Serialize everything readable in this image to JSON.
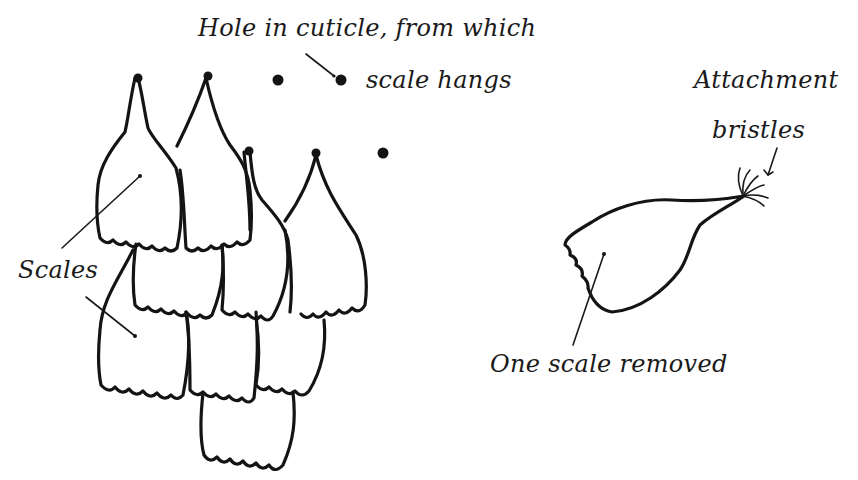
{
  "diagram": {
    "ink_color": "#141414",
    "background": "#ffffff",
    "labels": {
      "hole_line1": "Hole in cuticle, from which",
      "hole_line2": "scale hangs",
      "attachment_line1": "Attachment",
      "attachment_line2": "bristles",
      "scales": "Scales",
      "removed": "One scale removed"
    },
    "elements": [
      {
        "id": "scale-cluster",
        "description": "Tiled overlapping scales with scalloped lower edges"
      },
      {
        "id": "holes",
        "count": 4,
        "description": "Dots marking holes in cuticle"
      },
      {
        "id": "removed-scale",
        "description": "Single detached scale with attachment bristles at stalk tip"
      }
    ]
  }
}
